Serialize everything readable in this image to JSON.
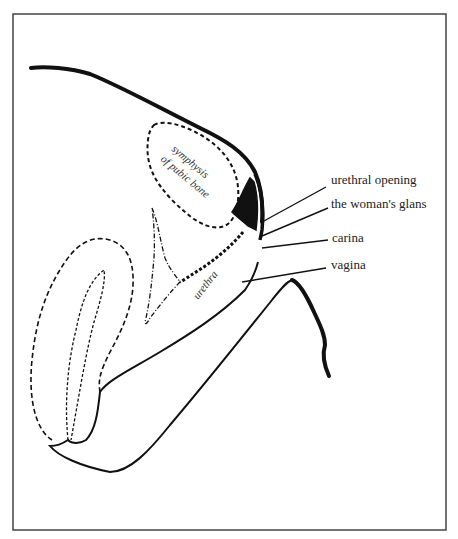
{
  "diagram": {
    "type": "anatomical line drawing (sagittal section)",
    "labels": {
      "urethral_opening": "urethral opening",
      "glans": "the woman's glans",
      "carina": "carina",
      "vagina": "vagina",
      "symphysis_line1": "symphysis",
      "symphysis_line2": "of pubic bone",
      "urethra": "urethra"
    },
    "colors": {
      "ink": "#111111",
      "frame": "#444444",
      "background": "#ffffff"
    }
  }
}
